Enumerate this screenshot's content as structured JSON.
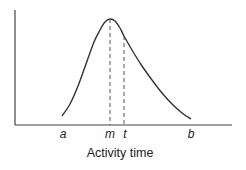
{
  "chart_data": {
    "type": "line",
    "title": "",
    "xlabel": "Activity time",
    "ylabel": "",
    "x_ticks": [
      "a",
      "m",
      "t",
      "b"
    ],
    "markers": [
      {
        "label": "m",
        "meaning": "mode (most likely time)",
        "style": "dashed vertical line to peak"
      },
      {
        "label": "t",
        "meaning": "expected time",
        "style": "dashed vertical line to curve"
      }
    ],
    "curve_points": [
      [
        62,
        116
      ],
      [
        70,
        104
      ],
      [
        78,
        86
      ],
      [
        86,
        64
      ],
      [
        94,
        42
      ],
      [
        100,
        30
      ],
      [
        105,
        22
      ],
      [
        110,
        19
      ],
      [
        115,
        21
      ],
      [
        120,
        28
      ],
      [
        124,
        36
      ],
      [
        132,
        50
      ],
      [
        142,
        66
      ],
      [
        152,
        80
      ],
      [
        162,
        93
      ],
      [
        172,
        104
      ],
      [
        182,
        113
      ],
      [
        191,
        119
      ]
    ],
    "grid": false,
    "legend": null
  },
  "labels": {
    "a": "a",
    "m": "m",
    "t": "t",
    "b": "b",
    "xlabel": "Activity time"
  }
}
